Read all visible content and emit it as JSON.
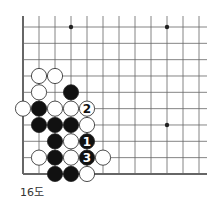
{
  "diagram": {
    "caption": "16도",
    "grid": {
      "origin_x": 23,
      "origin_y": 27,
      "dx": 16,
      "dy": 16.33,
      "cols": 12,
      "rows": 10,
      "right_extent": 207,
      "edge_left": true,
      "edge_bottom": true
    },
    "star_points": [
      [
        3,
        0
      ],
      [
        9,
        0
      ],
      [
        9,
        6
      ]
    ],
    "stones": [
      {
        "c": 1,
        "r": 3,
        "color": "white"
      },
      {
        "c": 2,
        "r": 3,
        "color": "white"
      },
      {
        "c": 1,
        "r": 4,
        "color": "white"
      },
      {
        "c": 3,
        "r": 4,
        "color": "black"
      },
      {
        "c": 0,
        "r": 5,
        "color": "white"
      },
      {
        "c": 1,
        "r": 5,
        "color": "black"
      },
      {
        "c": 2,
        "r": 5,
        "color": "white"
      },
      {
        "c": 3,
        "r": 5,
        "color": "white"
      },
      {
        "c": 4,
        "r": 5,
        "color": "white",
        "label": "2"
      },
      {
        "c": 1,
        "r": 6,
        "color": "black"
      },
      {
        "c": 2,
        "r": 6,
        "color": "black"
      },
      {
        "c": 3,
        "r": 6,
        "color": "black"
      },
      {
        "c": 4,
        "r": 6,
        "color": "white"
      },
      {
        "c": 2,
        "r": 7,
        "color": "black"
      },
      {
        "c": 3,
        "r": 7,
        "color": "white"
      },
      {
        "c": 4,
        "r": 7,
        "color": "black",
        "label": "1"
      },
      {
        "c": 1,
        "r": 8,
        "color": "white"
      },
      {
        "c": 2,
        "r": 8,
        "color": "black"
      },
      {
        "c": 3,
        "r": 8,
        "color": "white"
      },
      {
        "c": 4,
        "r": 8,
        "color": "black",
        "label": "3"
      },
      {
        "c": 5,
        "r": 8,
        "color": "white"
      },
      {
        "c": 2,
        "r": 9,
        "color": "black"
      },
      {
        "c": 3,
        "r": 9,
        "color": "black"
      },
      {
        "c": 4,
        "r": 9,
        "color": "white"
      }
    ]
  }
}
